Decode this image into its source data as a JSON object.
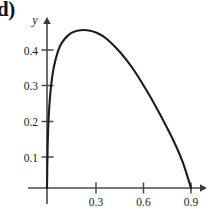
{
  "figure": {
    "part_label": "d)"
  },
  "chart_data": {
    "type": "line",
    "title": "",
    "xlabel": "",
    "ylabel": "y",
    "xlim": [
      -0.04,
      1.0
    ],
    "ylim": [
      -0.05,
      0.52
    ],
    "grid": false,
    "legend": false,
    "x_ticks": [
      0.3,
      0.6,
      0.9
    ],
    "x_tick_labels": [
      "0.3",
      "0.6",
      "0.9"
    ],
    "y_ticks": [
      0.1,
      0.2,
      0.3,
      0.4
    ],
    "y_tick_labels": [
      "0.1",
      "0.2",
      "0.3",
      "0.4"
    ],
    "axis_arrows": [
      "x-right",
      "y-up"
    ],
    "series": [
      {
        "name": "curve",
        "color": "#1c1c1c",
        "x": [
          0.0,
          0.004,
          0.01,
          0.02,
          0.035,
          0.055,
          0.08,
          0.11,
          0.15,
          0.19,
          0.23,
          0.27,
          0.31,
          0.35,
          0.4,
          0.45,
          0.5,
          0.55,
          0.6,
          0.65,
          0.7,
          0.75,
          0.8,
          0.85,
          0.9
        ],
        "y": [
          0.0,
          0.12,
          0.2,
          0.27,
          0.33,
          0.375,
          0.41,
          0.432,
          0.449,
          0.456,
          0.458,
          0.456,
          0.45,
          0.44,
          0.421,
          0.397,
          0.369,
          0.337,
          0.3,
          0.261,
          0.219,
          0.175,
          0.128,
          0.073,
          0.0
        ]
      }
    ],
    "annotations": {
      "peak_x": 0.23,
      "peak_y": 0.458,
      "x_intercept": 0.9
    }
  }
}
